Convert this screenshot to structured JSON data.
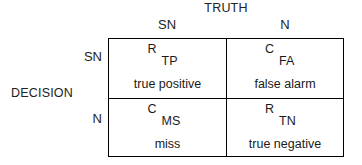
{
  "diagram": {
    "truth_label": "TRUTH",
    "decision_label": "DECISION",
    "truth_columns": [
      {
        "label": "SN"
      },
      {
        "label": "N"
      }
    ],
    "decision_rows": [
      {
        "label": "SN"
      },
      {
        "label": "N"
      }
    ],
    "cells": [
      {
        "code": "R",
        "abbr": "TP",
        "phrase": "true positive"
      },
      {
        "code": "C",
        "abbr": "FA",
        "phrase": "false alarm"
      },
      {
        "code": "C",
        "abbr": "MS",
        "phrase": "miss"
      },
      {
        "code": "R",
        "abbr": "TN",
        "phrase": "true negative"
      }
    ],
    "colors": {
      "border": "#000000",
      "text": "#1a1a1a",
      "background": "#ffffff"
    }
  }
}
